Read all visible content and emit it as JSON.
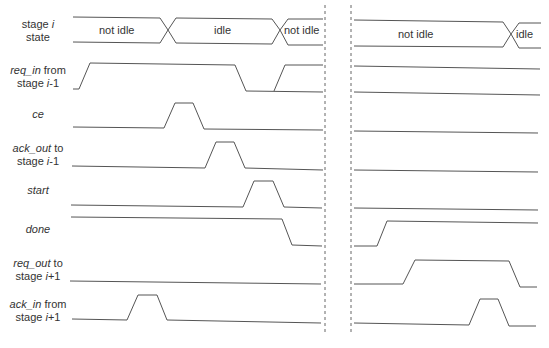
{
  "signals": [
    {
      "id": "state",
      "label_html": "stage <i>i</i><br>state"
    },
    {
      "id": "req_in",
      "label_html": "<i>req_in</i> from<br>stage <i>i</i>-1"
    },
    {
      "id": "ce",
      "label_html": "<i>ce</i>"
    },
    {
      "id": "ack_out",
      "label_html": "<i>ack_out</i> to<br>stage <i>i</i>-1"
    },
    {
      "id": "start",
      "label_html": "<i>start</i>"
    },
    {
      "id": "done",
      "label_html": "<i>done</i>"
    },
    {
      "id": "req_out",
      "label_html": "<i>req_out</i> to<br>stage <i>i</i>+1"
    },
    {
      "id": "ack_in",
      "label_html": "<i>ack_in</i> from<br>stage <i>i</i>+1"
    }
  ],
  "state_labels": {
    "left": [
      "not idle",
      "idle",
      "not idle"
    ],
    "right": [
      "not idle",
      "idle"
    ]
  },
  "colors": {
    "line": "#555555",
    "dash": "#666666",
    "text": "#333333"
  }
}
